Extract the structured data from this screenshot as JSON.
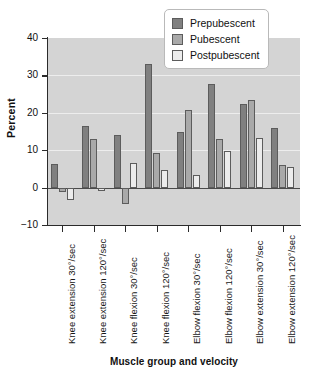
{
  "chart_data": {
    "type": "bar",
    "title": "",
    "subtitle": "",
    "xlabel": "Muscle group and velocity",
    "ylabel": "Percent",
    "ylim": [
      -10,
      40
    ],
    "yticks": [
      -10,
      0,
      10,
      20,
      30,
      40
    ],
    "ytick_labels": [
      "−10",
      "0",
      "10",
      "20",
      "30",
      "40"
    ],
    "grid": true,
    "legend_position": "top-right",
    "categories": [
      "Knee extension 30°/sec",
      "Knee extension 120°/sec",
      "Knee flexion 30°/sec",
      "Knee flexion 120°/sec",
      "Elbow flexion 30°/sec",
      "Elbow flexion 120°/sec",
      "Elbow extension 30°/sec",
      "Elbow extension 120°/sec"
    ],
    "series": [
      {
        "name": "Prepubescent",
        "color": "#808080",
        "values": [
          6.2,
          16.6,
          14.0,
          33.1,
          15.0,
          27.8,
          22.4,
          15.9
        ]
      },
      {
        "name": "Pubescent",
        "color": "#a9a9a9",
        "values": [
          -1.1,
          13.1,
          -4.4,
          9.3,
          20.7,
          13.1,
          23.3,
          6.1
        ]
      },
      {
        "name": "Postpubescent",
        "color": "#ececec",
        "values": [
          -3.3,
          -0.8,
          6.5,
          4.7,
          3.3,
          9.8,
          13.3,
          5.6
        ]
      }
    ]
  },
  "legend": {
    "items": [
      {
        "label": "Prepubescent"
      },
      {
        "label": "Pubescent"
      },
      {
        "label": "Postpubescent"
      }
    ]
  },
  "colors": {
    "prepubescent": "#808080",
    "pubescent": "#a9a9a9",
    "postpubescent": "#ececec",
    "plot_background": "#d4d4d4",
    "gridline": "#ededed",
    "axis": "#2b2b2b"
  }
}
